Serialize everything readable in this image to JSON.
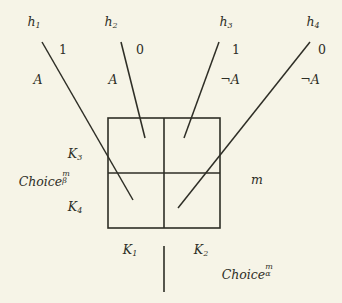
{
  "figure": {
    "background_color": "#f6f4e7",
    "line_color": "#2e2e26"
  },
  "hypotheses": [
    {
      "name": "h-1",
      "label": "h",
      "index": "1",
      "bit": "1",
      "atom": "A",
      "atom_negated": false
    },
    {
      "name": "h-2",
      "label": "h",
      "index": "2",
      "bit": "0",
      "atom": "A",
      "atom_negated": false
    },
    {
      "name": "h-3",
      "label": "h",
      "index": "3",
      "bit": "1",
      "atom": "¬A",
      "atom_negated": true
    },
    {
      "name": "h-4",
      "label": "h",
      "index": "4",
      "bit": "0",
      "atom": "¬A",
      "atom_negated": true
    }
  ],
  "cells": {
    "k1": {
      "label": "K",
      "index": "1"
    },
    "k2": {
      "label": "K",
      "index": "2"
    },
    "k3": {
      "label": "K",
      "index": "3"
    },
    "k4": {
      "label": "K",
      "index": "4"
    }
  },
  "choices": {
    "beta": {
      "base": "Choice",
      "sub": "β",
      "sup": "m"
    },
    "alpha": {
      "base": "Choice",
      "sub": "α",
      "sup": "m"
    }
  },
  "moment": {
    "label": "m"
  }
}
